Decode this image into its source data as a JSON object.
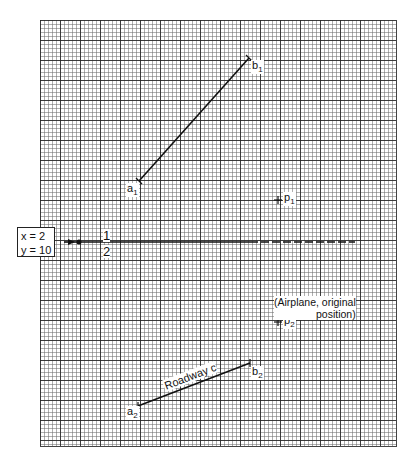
{
  "diagram": {
    "start_box": {
      "x_label": "x = 2",
      "y_label": "y = 10"
    },
    "fraction": {
      "numerator": "1",
      "denominator": "2"
    },
    "points": {
      "a1": {
        "label": "a",
        "sub": "1",
        "x": 139,
        "y": 181
      },
      "b1": {
        "label": "b",
        "sub": "1",
        "x": 249,
        "y": 58
      },
      "p1": {
        "label": "p",
        "sub": "1",
        "x": 278,
        "y": 200
      },
      "p2": {
        "label": "p",
        "sub": "2",
        "x": 278,
        "y": 322
      },
      "a2": {
        "label": "a",
        "sub": "2",
        "x": 138,
        "y": 406
      },
      "b2": {
        "label": "b",
        "sub": "2",
        "x": 250,
        "y": 363
      }
    },
    "airplane_note": {
      "line1": "(Airplane, original",
      "line2": "position)"
    },
    "roadway_label": "Roadway c",
    "colors": {
      "line": "#111111",
      "grid_major": "#282828",
      "grid_minor": "#6e6e6e"
    }
  }
}
